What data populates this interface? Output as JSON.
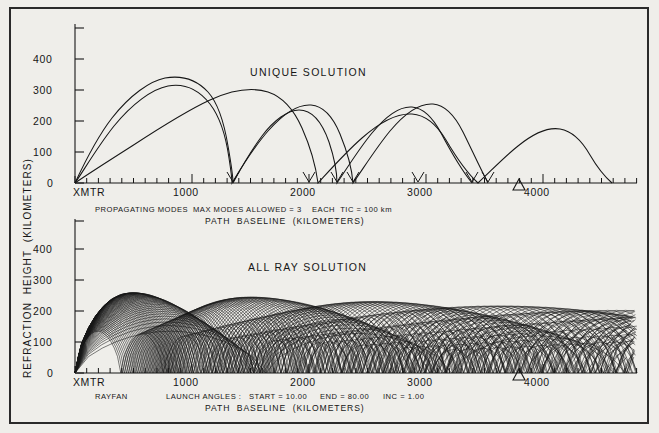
{
  "figure": {
    "axis_label_vertical": "REFRACTION  HEIGHT  (KILOMETERS)",
    "background_color": "#efeeea",
    "ink_color": "#161616"
  },
  "top_panel": {
    "title": "UNIQUE SOLUTION",
    "caption_line1_a": "PROPAGATING MODES",
    "caption_line1_b": "MAX MODES ALLOWED = 3",
    "caption_line1_c": "EACH  TIC = 100 km",
    "caption_line2": "PATH  BASELINE  (KILOMETERS)",
    "y_ticks": [
      "0",
      "100",
      "200",
      "300",
      "400"
    ],
    "x_ticks": [
      "XMTR",
      "1000",
      "2000",
      "3000",
      "4000"
    ],
    "receiver_marker_label": "receiver-triangle",
    "receiver_range_km": 3900
  },
  "bottom_panel": {
    "title": "ALL RAY SOLUTION",
    "caption_line1_a": "RAYFAN",
    "caption_line1_b": "LAUNCH ANGLES :",
    "caption_line1_c": "START = 10.00",
    "caption_line1_d": "END = 80.00",
    "caption_line1_e": "INC = 1.00",
    "caption_line2": "PATH  BASELINE  (KILOMETERS)",
    "y_ticks": [
      "0",
      "100",
      "200",
      "300",
      "400"
    ],
    "x_ticks": [
      "XMTR",
      "1000",
      "2000",
      "3000",
      "4000"
    ],
    "receiver_marker_label": "receiver-triangle",
    "receiver_range_km": 3900
  },
  "chart_data": [
    {
      "type": "line",
      "id": "unique-solution",
      "title": "UNIQUE SOLUTION",
      "xlabel": "PATH  BASELINE  (KILOMETERS)",
      "ylabel": "REFRACTION  HEIGHT  (KILOMETERS)",
      "xlim": [
        0,
        4800
      ],
      "ylim": [
        0,
        450
      ],
      "xticks": [
        0,
        1000,
        2000,
        3000,
        4000
      ],
      "xticklabels": [
        "XMTR",
        "1000",
        "2000",
        "3000",
        "4000"
      ],
      "yticks": [
        0,
        100,
        200,
        300,
        400
      ],
      "minor_tick_km": 100,
      "grid": false,
      "legend": "none",
      "annotations": [
        "PROPAGATING MODES",
        "MAX MODES ALLOWED = 3",
        "EACH  TIC = 100 km"
      ],
      "receiver_marker_x": 3900,
      "series": [
        {
          "name": "mode-3-hop (3 hops)",
          "hops": 3,
          "apogee_km": 262,
          "hop_length_km": 1300,
          "x": [
            0,
            130,
            300,
            470,
            650,
            820,
            1000,
            1170,
            1300,
            1450,
            1600,
            1790,
            1950,
            2170,
            2350,
            2600,
            2770,
            2950,
            3130,
            3300,
            3500,
            3700,
            3900
          ],
          "y": [
            0,
            100,
            190,
            240,
            262,
            258,
            225,
            150,
            0,
            110,
            190,
            245,
            232,
            175,
            90,
            0,
            120,
            200,
            235,
            220,
            170,
            90,
            0
          ]
        },
        {
          "name": "mode-4-hop (4 hops)",
          "hops": 4,
          "apogee_km": 235,
          "hop_length_km": 975,
          "x": [
            0,
            120,
            260,
            400,
            560,
            700,
            850,
            975,
            1100,
            1250,
            1400,
            1560,
            1700,
            1850,
            1950,
            2100,
            2250,
            2400,
            2560,
            2700,
            2850,
            2930,
            3080,
            3250,
            3400,
            3600,
            3750,
            3900
          ],
          "y": [
            0,
            95,
            170,
            215,
            235,
            230,
            165,
            0,
            105,
            185,
            228,
            222,
            170,
            75,
            0,
            110,
            190,
            230,
            215,
            160,
            60,
            0,
            120,
            200,
            225,
            195,
            120,
            0
          ]
        },
        {
          "name": "mode-5-hop (5 hops)",
          "hops": 5,
          "apogee_km": 222,
          "hop_length_km": 780,
          "x": [
            0,
            150,
            330,
            520,
            700,
            820,
            980,
            1100,
            1180,
            1300,
            1480,
            1660,
            1800,
            1950,
            2050,
            2200,
            2380,
            2530,
            2700,
            2850,
            2980,
            3150,
            3300,
            3480,
            3650,
            3800,
            3900
          ],
          "y": [
            0,
            60,
            120,
            175,
            212,
            222,
            205,
            140,
            60,
            0,
            110,
            185,
            212,
            190,
            140,
            60,
            0,
            110,
            190,
            210,
            195,
            150,
            95,
            160,
            205,
            150,
            0
          ]
        }
      ]
    },
    {
      "type": "line",
      "id": "all-ray-solution",
      "title": "ALL RAY SOLUTION",
      "xlabel": "PATH  BASELINE  (KILOMETERS)",
      "ylabel": "REFRACTION  HEIGHT  (KILOMETERS)",
      "xlim": [
        0,
        4800
      ],
      "ylim": [
        0,
        450
      ],
      "xticks": [
        0,
        1000,
        2000,
        3000,
        4000
      ],
      "xticklabels": [
        "XMTR",
        "1000",
        "2000",
        "3000",
        "4000"
      ],
      "yticks": [
        0,
        100,
        200,
        300,
        400
      ],
      "minor_tick_km": 100,
      "grid": false,
      "legend": "none",
      "annotations": [
        "RAYFAN",
        "LAUNCH ANGLES :",
        "START = 10.00",
        "END = 80.00",
        "INC = 1.00"
      ],
      "receiver_marker_x": 3900,
      "launch_angle_start_deg": 10.0,
      "launch_angle_end_deg": 80.0,
      "launch_angle_inc_deg": 1.0,
      "ray_count": 71,
      "caustic_apogee_km": 235,
      "description": "Fan of 71 rays launched from XMTR at 10-80 degrees in 1 degree steps; rays refract and hop repeatedly forming a crossing mesh with caustic envelope near 230 km."
    }
  ]
}
